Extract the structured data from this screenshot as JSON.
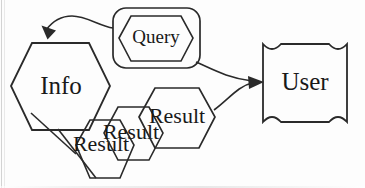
{
  "diagram": {
    "style": {
      "background_color": "#fdfdfd",
      "stroke_color": "#2a2a2a",
      "fill_gray": "#c8c8c8",
      "fill_white": "#ffffff",
      "text_color": "#191919"
    },
    "nodes": [
      {
        "id": "info",
        "label": "Info",
        "shape": "hexagon",
        "fill": "gray",
        "x": 60,
        "y": 86
      },
      {
        "id": "query",
        "label": "Query",
        "shape": "hexagon-in-rounded-rect",
        "fill": "white",
        "x": 157,
        "y": 38
      },
      {
        "id": "user",
        "label": "User",
        "shape": "concave-corner-box",
        "fill": "gray",
        "x": 305,
        "y": 83
      },
      {
        "id": "result-back",
        "label": "Result",
        "shape": "hexagon",
        "fill": "white",
        "x": 105,
        "y": 145
      },
      {
        "id": "result-mid",
        "label": "Result",
        "shape": "hexagon",
        "fill": "white",
        "x": 133,
        "y": 133
      },
      {
        "id": "result-front",
        "label": "Result",
        "shape": "hexagon",
        "fill": "white",
        "x": 177,
        "y": 117
      }
    ],
    "edges": [
      {
        "id": "query-to-info",
        "from": "query",
        "to": "info",
        "arrow": true,
        "style": "curved"
      },
      {
        "id": "query-to-user",
        "from": "query",
        "to": "user",
        "arrow": true,
        "style": "curved"
      },
      {
        "id": "result-to-user",
        "from": "result-front",
        "to": "user",
        "arrow": true,
        "style": "curved"
      },
      {
        "id": "info-to-result",
        "from": "info",
        "to": "result-back",
        "arrow": false,
        "style": "straight"
      }
    ]
  }
}
